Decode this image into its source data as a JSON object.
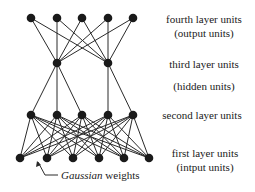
{
  "diagram": {
    "type": "neural-network",
    "layers": [
      {
        "id": "fourth",
        "label": "fourth layer units",
        "sublabel": "(output units)",
        "y": 18,
        "x": [
          31,
          57,
          82,
          108,
          133
        ]
      },
      {
        "id": "third",
        "label": "third layer units",
        "sublabel": "(hidden units)",
        "y": 63,
        "x": [
          57,
          108
        ]
      },
      {
        "id": "second",
        "label": "second layer units",
        "sublabel": "",
        "y": 115,
        "x": [
          31,
          57,
          82,
          108,
          133
        ]
      },
      {
        "id": "first",
        "label": "first layer units",
        "sublabel": "(intput units)",
        "y": 158,
        "x": [
          20,
          47,
          73,
          99,
          124,
          149
        ]
      }
    ],
    "connections": {
      "fourth_third": "full",
      "third_second": [
        [
          0,
          0
        ],
        [
          0,
          1
        ],
        [
          0,
          2
        ],
        [
          1,
          3
        ],
        [
          1,
          4
        ]
      ],
      "second_first": "full"
    },
    "annotation": {
      "italic": "Gaussian",
      "rest": " weights",
      "arrow": {
        "from": [
          45,
          175
        ],
        "to": [
          38,
          162
        ]
      }
    },
    "colors": {
      "node": "#1a1a1a",
      "edge": "#2a2a2a",
      "text": "#1a1a1a",
      "background": "#ffffff"
    },
    "node_radius": 4.3
  },
  "labels": {
    "fourth_title": "fourth layer units",
    "fourth_sub": "(output units)",
    "third_title": "third layer units",
    "third_sub": "(hidden units)",
    "second_title": "second layer units",
    "first_title": "first layer units",
    "first_sub": "(intput units)",
    "gaussian_italic": "Gaussian",
    "gaussian_rest": " weights"
  }
}
